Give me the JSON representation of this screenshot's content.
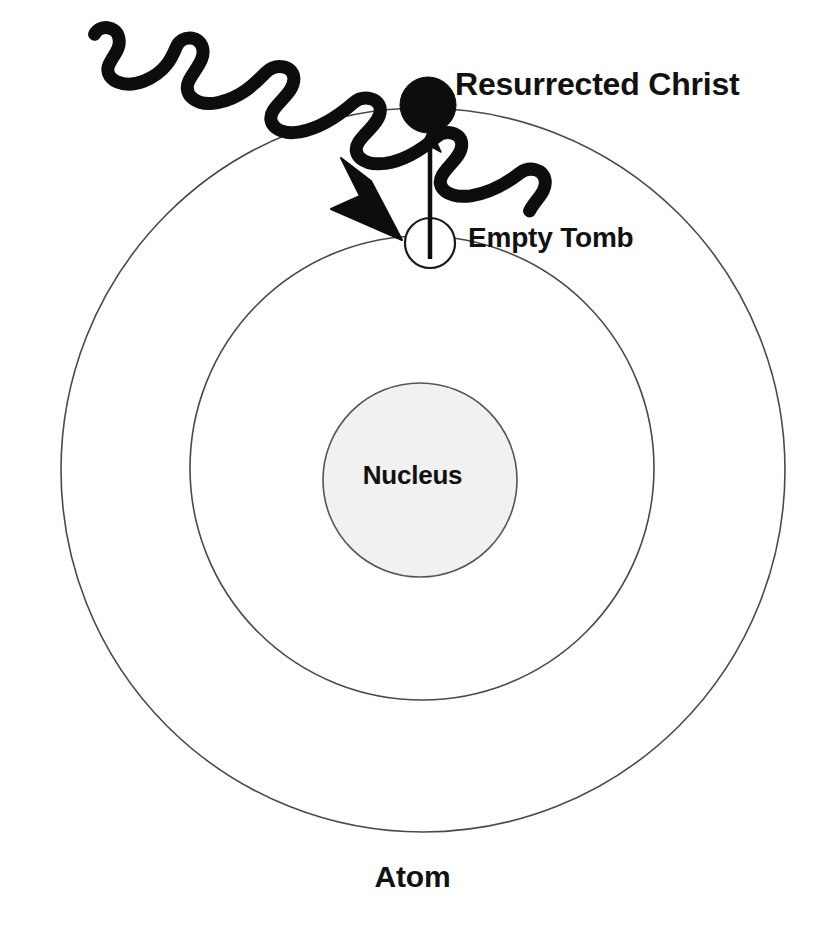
{
  "diagram": {
    "title": "Atom",
    "background_color": "#ffffff",
    "labels": {
      "resurrected_christ": "Resurrected Christ",
      "empty_tomb": "Empty Tomb",
      "nucleus": "Nucleus",
      "atom": "Atom"
    },
    "colors": {
      "orbit_stroke": "#4a4a4a",
      "nucleus_fill": "#f1f1f1",
      "nucleus_stroke": "#555555",
      "electron_fill": "#0d0d0d",
      "empty_tomb_fill": "#ffffff",
      "empty_tomb_stroke": "#1a1a1a",
      "wave_stroke": "#0d0d0d",
      "arrow_stroke": "#0d0d0d",
      "text": "#111111"
    },
    "shapes": {
      "outer_orbit": {
        "cx": 423,
        "cy": 470,
        "r": 362,
        "stroke_width": 1.6
      },
      "inner_orbit": {
        "cx": 422,
        "cy": 468,
        "r": 232,
        "stroke_width": 1.6
      },
      "nucleus": {
        "cx": 420,
        "cy": 480,
        "r": 97,
        "stroke_width": 1.6
      },
      "resurrected_christ_particle": {
        "cx": 428,
        "cy": 105,
        "r": 28
      },
      "empty_tomb_particle": {
        "cx": 430,
        "cy": 243,
        "r": 25,
        "stroke_width": 2.2
      },
      "promotion_arrow": {
        "x": 430,
        "y_from": 258,
        "y_to": 136,
        "stroke_width": 4
      },
      "incoming_wave": {
        "start_x": 130,
        "start_y": 50,
        "tip_x": 400,
        "tip_y": 238,
        "stroke_width": 13
      }
    }
  }
}
